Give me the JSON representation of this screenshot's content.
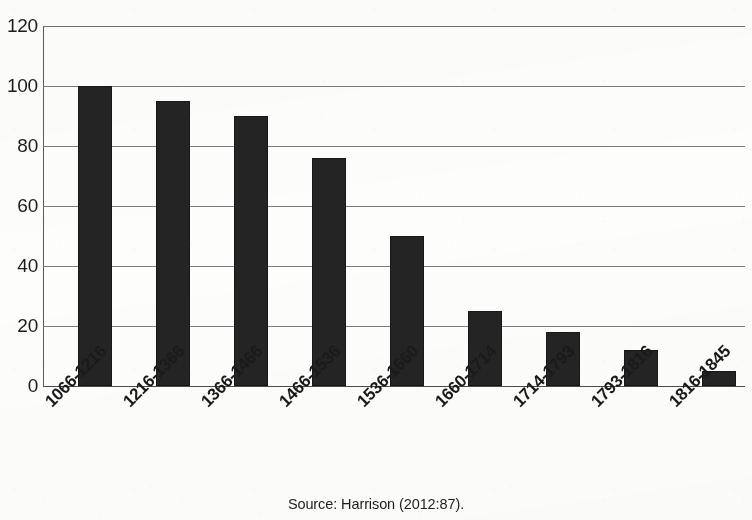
{
  "figure": {
    "background_color": "#fdfdfc",
    "bar_color": "#242424",
    "gridline_color": "#7d7d7d",
    "axis_color": "#5a5a5a",
    "text_color": "#1a1a1a"
  },
  "caption": {
    "source_text": "Source: Harrison (2012:87)."
  },
  "chart_data": {
    "type": "bar",
    "title": "",
    "subtitle": "",
    "xlabel": "",
    "ylabel": "",
    "categories": [
      "1066-1216",
      "1216-1366",
      "1366-1466",
      "1466-1536",
      "1536-1660",
      "1660-1714",
      "1714-1793",
      "1793-1816",
      "1816-1845"
    ],
    "values": [
      100,
      95,
      90,
      76,
      50,
      25,
      18,
      12,
      5
    ],
    "ylim": [
      0,
      120
    ],
    "y_ticks": [
      0,
      20,
      40,
      60,
      80,
      100,
      120
    ],
    "y_tick_labels": [
      "0",
      "20",
      "40",
      "60",
      "80",
      "100",
      "120"
    ],
    "grid": "horizontal",
    "legend": "none",
    "legend_position": "none",
    "x_tick_rotation": -45,
    "annotations": []
  }
}
